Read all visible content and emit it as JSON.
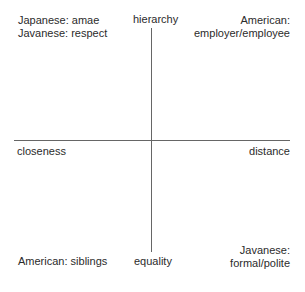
{
  "figure": {
    "background_color": "#ffffff",
    "line_color": "#666666",
    "text_color": "#2b2b2b"
  },
  "axes": {
    "vertical": {
      "top_label": "hierarchy",
      "bottom_label": "equality"
    },
    "horizontal": {
      "left_label": "closeness",
      "right_label": "distance"
    }
  },
  "quadrants": {
    "top_left": {
      "lines": [
        "Japanese: amae",
        "Javanese: respect"
      ]
    },
    "top_right": {
      "lines": [
        "American:",
        "employer/employee"
      ]
    },
    "bottom_left": {
      "lines": [
        "American: siblings"
      ]
    },
    "bottom_right": {
      "lines": [
        "Javanese:",
        "formal/polite"
      ]
    }
  },
  "chart_data": {
    "type": "scatter",
    "title": "",
    "xlabel": "",
    "ylabel": "",
    "grid": false,
    "legend_position": "none",
    "x_axis": {
      "negative_pole": "closeness",
      "positive_pole": "distance"
    },
    "y_axis": {
      "negative_pole": "equality",
      "positive_pole": "hierarchy"
    },
    "annotations": [
      {
        "text": "Japanese: amae\nJavanese: respect",
        "quadrant": "top-left",
        "x_pole": "closeness",
        "y_pole": "hierarchy"
      },
      {
        "text": "American:\nemployer/employee",
        "quadrant": "top-right",
        "x_pole": "distance",
        "y_pole": "hierarchy"
      },
      {
        "text": "American: siblings",
        "quadrant": "bottom-left",
        "x_pole": "closeness",
        "y_pole": "equality"
      },
      {
        "text": "Javanese:\nformal/polite",
        "quadrant": "bottom-right",
        "x_pole": "distance",
        "y_pole": "equality"
      }
    ]
  }
}
